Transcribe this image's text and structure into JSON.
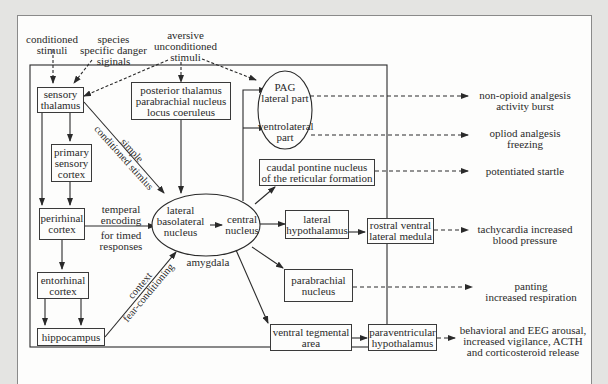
{
  "diagram": {
    "inputs": {
      "conditioned_stimuli": "conditioned\nstimuli",
      "species_danger": "species\nspecific danger\nsiginals",
      "aversive_unconditioned": "aversive\nunconditioned\nstimuli"
    },
    "nodes": {
      "sensory_thalamus": "sensory\nthalamus",
      "posterior_thalamus": "posterior thalamus\nparabrachial nucleus\nlocus coeruleus",
      "primary_sensory_cortex": "primary\nsensory\ncortex",
      "perirhinal_cortex": "perirhinal\ncortex",
      "entorhinal_cortex": "entorhinal\ncortex",
      "hippocampus": "hippocampus",
      "lateral_basolateral": "lateral\nbasolateral\nnucleus",
      "central_nucleus": "central\nnucleus",
      "amygdala": "amygdala",
      "pag_lateral": "PAG\nlateral part",
      "pag_ventrolateral": "ventrolateral\npart",
      "caudal_pontine": "caudal pontine nucleus\nof the reticular formation",
      "lateral_hypothalamus": "lateral\nhypothalamus",
      "rostral_ventral": "rostral ventral\nlateral medula",
      "parabrachial_nucleus": "parabrachial\nnucleus",
      "ventral_tegmental": "ventral tegmental\narea",
      "paraventricular": "paraventricular\nhypothalamus"
    },
    "edge_labels": {
      "simple_conditioned": "simple\nconditioned stimlus",
      "temperal_encoding": "temperal\nencoding",
      "for_timed": "for timed\nresponses",
      "context": "context\nfear-conditioning"
    },
    "outputs": {
      "non_opioid": "non-opioid analgesis\nactivity burst",
      "opioid": "opliod analgesis\nfreezing",
      "startle": "potentiated startle",
      "tachycardia": "tachycardia increased\nblood pressure",
      "panting": "panting\nincreased respiration",
      "arousal": "behavioral and EEG arousal,\nincreased vigilance, ACTH\nand corticosteroid release"
    }
  }
}
